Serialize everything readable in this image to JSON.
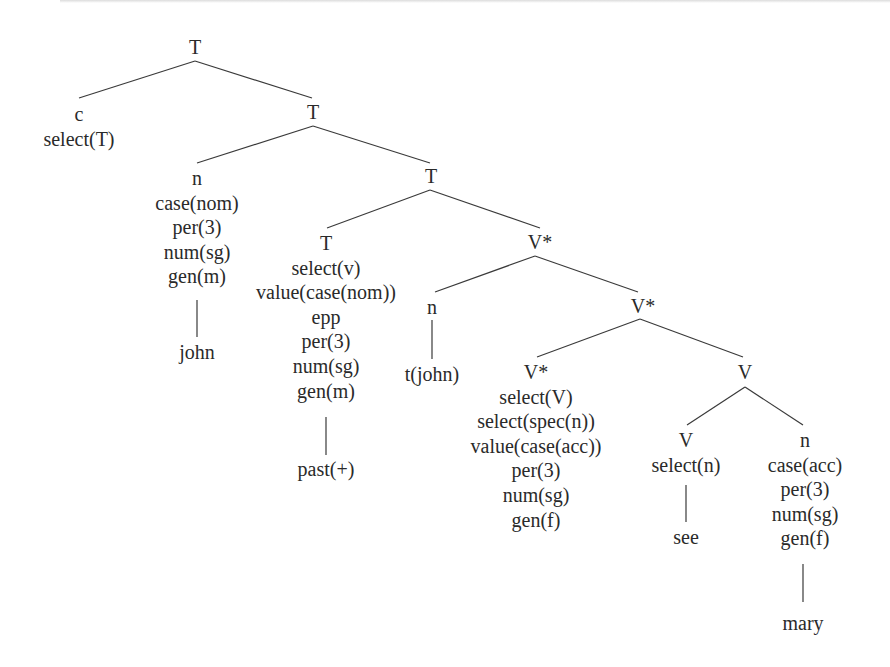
{
  "diagram": {
    "type": "syntax-tree",
    "nodes": [
      {
        "id": "t1",
        "lines": [
          "T"
        ]
      },
      {
        "id": "c1",
        "lines": [
          "c",
          "select(T)"
        ]
      },
      {
        "id": "t2",
        "lines": [
          "T"
        ]
      },
      {
        "id": "n1",
        "lines": [
          "n",
          "case(nom)",
          "per(3)",
          "num(sg)",
          "gen(m)"
        ]
      },
      {
        "id": "john",
        "lines": [
          "john"
        ]
      },
      {
        "id": "t3",
        "lines": [
          "T"
        ]
      },
      {
        "id": "t4",
        "lines": [
          "T",
          "select(v)",
          "value(case(nom))",
          "epp",
          "per(3)",
          "num(sg)",
          "gen(m)"
        ]
      },
      {
        "id": "past",
        "lines": [
          "past(+)"
        ]
      },
      {
        "id": "vs1",
        "lines": [
          "V*"
        ]
      },
      {
        "id": "n2",
        "lines": [
          "n"
        ]
      },
      {
        "id": "tjohn",
        "lines": [
          "t(john)"
        ]
      },
      {
        "id": "vs2",
        "lines": [
          "V*"
        ]
      },
      {
        "id": "vs3",
        "lines": [
          "V*",
          "select(V)",
          "select(spec(n))",
          "value(case(acc))",
          "per(3)",
          "num(sg)",
          "gen(f)"
        ]
      },
      {
        "id": "v1",
        "lines": [
          "V"
        ]
      },
      {
        "id": "v2",
        "lines": [
          "V",
          "select(n)"
        ]
      },
      {
        "id": "see",
        "lines": [
          "see"
        ]
      },
      {
        "id": "n3",
        "lines": [
          "n",
          "case(acc)",
          "per(3)",
          "num(sg)",
          "gen(f)"
        ]
      },
      {
        "id": "mary",
        "lines": [
          "mary"
        ]
      }
    ],
    "edges": [
      [
        "t1",
        "c1"
      ],
      [
        "t1",
        "t2"
      ],
      [
        "t2",
        "n1"
      ],
      [
        "t2",
        "t3"
      ],
      [
        "n1",
        "john"
      ],
      [
        "t3",
        "t4"
      ],
      [
        "t3",
        "vs1"
      ],
      [
        "t4",
        "past"
      ],
      [
        "vs1",
        "n2"
      ],
      [
        "vs1",
        "vs2"
      ],
      [
        "n2",
        "tjohn"
      ],
      [
        "vs2",
        "vs3"
      ],
      [
        "vs2",
        "v1"
      ],
      [
        "v1",
        "v2"
      ],
      [
        "v1",
        "n3"
      ],
      [
        "v2",
        "see"
      ],
      [
        "n3",
        "mary"
      ]
    ]
  }
}
